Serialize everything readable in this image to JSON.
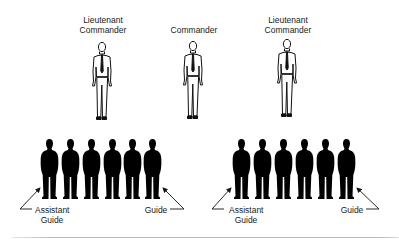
{
  "officers": [
    {
      "title_line1": "Lieutenant",
      "title_line2": "Commander"
    },
    {
      "title_line1": "Commander",
      "title_line2": ""
    },
    {
      "title_line1": "Lieutenant",
      "title_line2": "Commander"
    }
  ],
  "formations": [
    {
      "count": 6,
      "left_label_line1": "Assistant",
      "left_label_line2": "Guide",
      "right_label": "Guide"
    },
    {
      "count": 6,
      "left_label_line1": "Assistant",
      "left_label_line2": "Guide",
      "right_label": "Guide"
    }
  ],
  "colors": {
    "silhouette": "#000000",
    "line": "#111111",
    "rule": "#b9b9b9"
  }
}
